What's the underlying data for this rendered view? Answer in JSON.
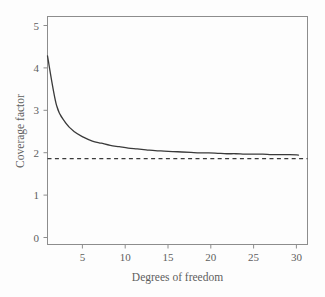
{
  "chart_data": {
    "type": "line",
    "title": "",
    "subtitle": "",
    "xlabel": "Degrees of freedom",
    "ylabel": "Coverage factor",
    "xlim": [
      2,
      31
    ],
    "ylim": [
      0,
      5.2
    ],
    "xticks": [
      5,
      10,
      15,
      20,
      25,
      30
    ],
    "yticks": [
      0,
      1,
      2,
      3,
      4,
      5
    ],
    "xtick_labels": [
      "5",
      "10",
      "15",
      "20",
      "25",
      "30"
    ],
    "ytick_labels": [
      "0",
      "1",
      "2",
      "3",
      "4",
      "5"
    ],
    "grid": false,
    "legend_position": "none",
    "series": [
      {
        "name": "Coverage factor (Student t, 95%)",
        "style": "solid",
        "color": "#3a3a3a",
        "x": [
          2,
          3,
          4,
          5,
          6,
          7,
          8,
          9,
          10,
          11,
          12,
          13,
          14,
          15,
          16,
          17,
          18,
          19,
          20,
          21,
          22,
          23,
          24,
          25,
          26,
          27,
          28,
          29,
          30
        ],
        "values": [
          4.3,
          3.18,
          2.78,
          2.57,
          2.45,
          2.36,
          2.31,
          2.26,
          2.23,
          2.2,
          2.18,
          2.16,
          2.14,
          2.13,
          2.12,
          2.11,
          2.1,
          2.09,
          2.09,
          2.08,
          2.07,
          2.07,
          2.06,
          2.06,
          2.06,
          2.05,
          2.05,
          2.05,
          2.04
        ]
      },
      {
        "name": "Asymptotic coverage factor (normal, 95%)",
        "style": "dashed",
        "color": "#3a3a3a",
        "x": [
          2,
          31
        ],
        "values": [
          1.96,
          1.96
        ]
      }
    ],
    "annotations": []
  },
  "axes": {
    "y_axis_title": "Coverage factor",
    "x_axis_title": "Degrees of freedom"
  }
}
